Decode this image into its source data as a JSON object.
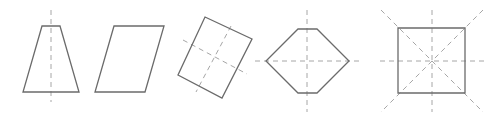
{
  "figure": {
    "colors": {
      "outline": "#6b6b6b",
      "axis": "#a6a6a6",
      "background": "#ffffff"
    },
    "shapes": [
      {
        "name": "isosceles-trapezoid",
        "points": "42,26 60,26 79,92 23,92",
        "axes": [
          {
            "x1": 51,
            "y1": 10,
            "x2": 51,
            "y2": 102
          }
        ]
      },
      {
        "name": "parallelogram",
        "points": "114,26 164,26 145,92 95,92",
        "axes": []
      },
      {
        "name": "rotated-rectangle",
        "points": "205,17 252,39 222,98 178,75",
        "axes": [
          {
            "x1": 231,
            "y1": 26,
            "x2": 196,
            "y2": 92
          },
          {
            "x1": 183,
            "y1": 40,
            "x2": 247,
            "y2": 74
          }
        ]
      },
      {
        "name": "hexagon",
        "points": "298,29 317,29 349,61 317,93 298,93 266,61",
        "axes": [
          {
            "x1": 307,
            "y1": 10,
            "x2": 307,
            "y2": 112
          },
          {
            "x1": 255,
            "y1": 61,
            "x2": 359,
            "y2": 61
          }
        ]
      },
      {
        "name": "square",
        "points": "398,28 465,28 465,93 398,93",
        "axes": [
          {
            "x1": 432,
            "y1": 10,
            "x2": 432,
            "y2": 112
          },
          {
            "x1": 380,
            "y1": 61,
            "x2": 484,
            "y2": 61
          },
          {
            "x1": 381,
            "y1": 10,
            "x2": 483,
            "y2": 112
          },
          {
            "x1": 483,
            "y1": 10,
            "x2": 381,
            "y2": 112
          }
        ]
      }
    ]
  }
}
